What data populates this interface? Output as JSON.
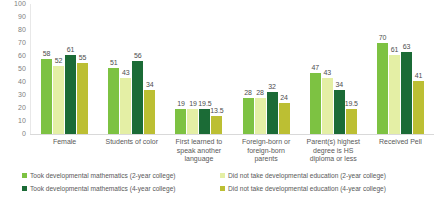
{
  "chart_data": {
    "type": "bar",
    "title": "",
    "xlabel": "",
    "ylabel": "",
    "ylim": [
      0,
      100
    ],
    "yticks": [
      100,
      90,
      80,
      70,
      60,
      50,
      40,
      30,
      20,
      10,
      0
    ],
    "grid": false,
    "legend_position": "bottom",
    "categories": [
      "Female",
      "Students of color",
      "First learned to speak another language",
      "Foreign-born or foreign-born parents",
      "Parent(s) highest degree is HS diploma or less",
      "Received Pell"
    ],
    "series": [
      {
        "name": "Took developmental mathematics (2-year college)",
        "color": "#7DC242",
        "values": [
          58,
          51,
          19,
          28,
          47,
          70
        ]
      },
      {
        "name": "Did not take developmental education (2-year college)",
        "color": "#E4EFA5",
        "values": [
          52,
          43,
          19,
          28,
          43,
          61
        ]
      },
      {
        "name": "Took developmental mathematics (4-year college)",
        "color": "#1B6B36",
        "values": [
          61,
          56,
          19.5,
          32,
          34,
          63
        ]
      },
      {
        "name": "Did not take developmental education (4-year college)",
        "color": "#BCBF33",
        "values": [
          55,
          34,
          13.5,
          24,
          19.5,
          41
        ]
      }
    ]
  },
  "axis": {
    "y_tick_labels": [
      "100",
      "90",
      "80",
      "70",
      "60",
      "50",
      "40",
      "30",
      "20",
      "10",
      "0"
    ]
  },
  "category_labels": [
    "Female",
    "Students of color",
    "First learned to\nspeak another\nlanguage",
    "Foreign-born or\nforeign-born\nparents",
    "Parent(s) highest\ndegree is HS\ndiploma or less",
    "Received Pell"
  ],
  "data_labels": [
    [
      "58",
      "52",
      "61",
      "55"
    ],
    [
      "51",
      "43",
      "56",
      "34"
    ],
    [
      "19",
      "19",
      "19.5",
      "13.5"
    ],
    [
      "28",
      "28",
      "32",
      "24"
    ],
    [
      "47",
      "43",
      "34",
      "19.5"
    ],
    [
      "70",
      "61",
      "63",
      "41"
    ]
  ],
  "legend": {
    "items": [
      {
        "label": "Took developmental mathematics (2-year college)",
        "color": "#7DC242"
      },
      {
        "label": "Did not take developmental education (2-year college)",
        "color": "#E4EFA5"
      },
      {
        "label": "Took developmental mathematics (4-year college)",
        "color": "#1B6B36"
      },
      {
        "label": "Did not take developmental education (4-year college)",
        "color": "#BCBF33"
      }
    ]
  },
  "colors": {
    "series_1": "#7DC242",
    "series_2": "#E4EFA5",
    "series_3": "#1B6B36",
    "series_4": "#BCBF33",
    "axis_text": "#808080",
    "label_text": "#595959",
    "axis_line": "#d9d9d9",
    "background": "#ffffff"
  }
}
